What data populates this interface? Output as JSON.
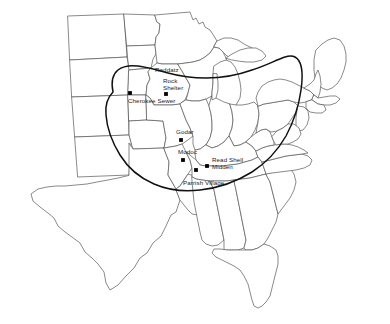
{
  "figure": {
    "kind": "archaeological-site-distribution-map",
    "region_name": "Midwest and Eastern United States",
    "background_color": "#ffffff",
    "outline_color": "#585858",
    "boundary_color": "#111111",
    "marker_color": "#000000",
    "label_color": "#1a1a1a"
  },
  "sites": [
    {
      "name": "Raddatz",
      "label_lines": [
        "Raddatz"
      ],
      "label_x": 155,
      "label_y": 66,
      "marker_x": 0,
      "marker_y": 0,
      "has_marker": false
    },
    {
      "name": "Rock Shelter",
      "label_lines": [
        "Rock",
        "Shelter"
      ],
      "label_x": 163,
      "label_y": 77,
      "marker_x": 166,
      "marker_y": 94,
      "has_marker": true
    },
    {
      "name": "Cherokee Sewer",
      "label_lines": [
        "Cherokee Sewer"
      ],
      "label_x": 128,
      "label_y": 97,
      "marker_x": 130,
      "marker_y": 93,
      "has_marker": true
    },
    {
      "name": "Godar",
      "label_lines": [
        "Godar"
      ],
      "label_x": 176,
      "label_y": 128,
      "marker_x": 181,
      "marker_y": 140,
      "has_marker": true
    },
    {
      "name": "Modoc",
      "label_lines": [
        "Modoc"
      ],
      "label_x": 178,
      "label_y": 148,
      "marker_x": 183,
      "marker_y": 160,
      "has_marker": true
    },
    {
      "name": "Read Shell Midden",
      "label_lines": [
        "Read Shell",
        "Midden"
      ],
      "label_x": 212,
      "label_y": 156,
      "marker_x": 207,
      "marker_y": 166,
      "has_marker": true
    },
    {
      "name": "Parrish Village",
      "label_lines": [
        "Parrish Village"
      ],
      "label_x": 183,
      "label_y": 179,
      "marker_x": 196,
      "marker_y": 170,
      "has_marker": true
    }
  ]
}
